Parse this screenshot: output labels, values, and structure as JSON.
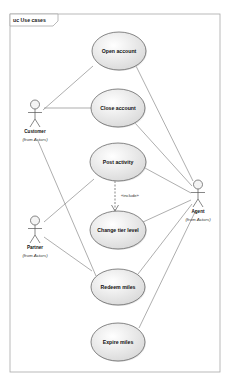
{
  "frame": {
    "title": "uc Use cases",
    "x": 10,
    "y": 14,
    "width": 210,
    "height": 358,
    "tab_width": 48,
    "tab_height": 12,
    "border_color": "#a8a8a8"
  },
  "colors": {
    "ellipse_fill_center": "#ffffff",
    "ellipse_fill_edge": "#d9d9d9",
    "ellipse_stroke": "#555555",
    "line": "#777777",
    "actor_stroke": "#555555"
  },
  "actors": [
    {
      "id": "customer",
      "name": "Customer",
      "from": "(from Actors)",
      "x": 35,
      "y": 100
    },
    {
      "id": "partner",
      "name": "Partner",
      "from": "(from Actors)",
      "x": 35,
      "y": 216
    },
    {
      "id": "agent",
      "name": "Agent",
      "from": "(from Actors)",
      "x": 198,
      "y": 180
    }
  ],
  "use_cases": [
    {
      "id": "open",
      "label": "Open account",
      "cx": 119,
      "cy": 51,
      "rx": 27,
      "ry": 19
    },
    {
      "id": "close",
      "label": "Close account",
      "cx": 118,
      "cy": 108,
      "rx": 27,
      "ry": 19
    },
    {
      "id": "post",
      "label": "Post activity",
      "cx": 118,
      "cy": 162,
      "rx": 28,
      "ry": 19
    },
    {
      "id": "change",
      "label": "Change tier level",
      "cx": 118,
      "cy": 230,
      "rx": 28,
      "ry": 19
    },
    {
      "id": "redeem",
      "label": "Redeem miles",
      "cx": 118,
      "cy": 287,
      "rx": 27,
      "ry": 18
    },
    {
      "id": "expire",
      "label": "Expire miles",
      "cx": 118,
      "cy": 342,
      "rx": 27,
      "ry": 19
    }
  ],
  "associations": [
    {
      "from": "customer",
      "to": "open",
      "x1": 43,
      "y1": 110,
      "x2": 93,
      "y2": 66
    },
    {
      "from": "customer",
      "to": "close",
      "x1": 44,
      "y1": 108,
      "x2": 91,
      "y2": 108
    },
    {
      "from": "customer",
      "to": "redeem",
      "x1": 38,
      "y1": 141,
      "x2": 96,
      "y2": 276
    },
    {
      "from": "partner",
      "to": "post",
      "x1": 44,
      "y1": 222,
      "x2": 94,
      "y2": 179
    },
    {
      "from": "partner",
      "to": "redeem",
      "x1": 44,
      "y1": 237,
      "x2": 92,
      "y2": 271
    },
    {
      "from": "agent",
      "to": "open",
      "x1": 193,
      "y1": 181,
      "x2": 136,
      "y2": 66
    },
    {
      "from": "agent",
      "to": "close",
      "x1": 192,
      "y1": 186,
      "x2": 135,
      "y2": 123
    },
    {
      "from": "agent",
      "to": "post",
      "x1": 191,
      "y1": 193,
      "x2": 145,
      "y2": 168
    },
    {
      "from": "agent",
      "to": "change",
      "x1": 191,
      "y1": 200,
      "x2": 143,
      "y2": 222
    },
    {
      "from": "agent",
      "to": "redeem",
      "x1": 192,
      "y1": 204,
      "x2": 138,
      "y2": 274
    },
    {
      "from": "agent",
      "to": "expire",
      "x1": 196,
      "y1": 210,
      "x2": 139,
      "y2": 328
    }
  ],
  "dependencies": [
    {
      "from": "post",
      "to": "change",
      "stereotype": "«include»",
      "x1": 115,
      "y1": 181,
      "x2": 115,
      "y2": 211,
      "label_x": 121,
      "label_y": 197
    }
  ]
}
